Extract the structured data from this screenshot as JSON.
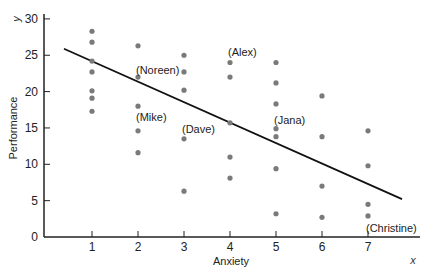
{
  "chart_data": {
    "type": "scatter",
    "title": "",
    "xlabel": "Anxiety",
    "ylabel": "Performance",
    "x_axis_var": "x",
    "y_axis_var": "y",
    "xlim": [
      0,
      8
    ],
    "ylim": [
      0,
      30
    ],
    "xticks": [
      1,
      2,
      3,
      4,
      5,
      6,
      7
    ],
    "yticks": [
      0,
      5,
      10,
      15,
      20,
      25,
      30
    ],
    "grid": false,
    "legend": null,
    "points": [
      {
        "x": 1,
        "y": 28.3
      },
      {
        "x": 1,
        "y": 26.8
      },
      {
        "x": 1,
        "y": 24.2
      },
      {
        "x": 1,
        "y": 22.7
      },
      {
        "x": 1,
        "y": 20.1
      },
      {
        "x": 1,
        "y": 19.1
      },
      {
        "x": 1,
        "y": 17.3
      },
      {
        "x": 2,
        "y": 26.3
      },
      {
        "x": 2,
        "y": 22.0,
        "label": "(Noreen)"
      },
      {
        "x": 2,
        "y": 18.0,
        "label": "(Mike)"
      },
      {
        "x": 2,
        "y": 14.6
      },
      {
        "x": 2,
        "y": 11.6
      },
      {
        "x": 3,
        "y": 25.0
      },
      {
        "x": 3,
        "y": 22.7
      },
      {
        "x": 3,
        "y": 20.2
      },
      {
        "x": 3,
        "y": 13.5,
        "label": "(Dave)"
      },
      {
        "x": 3,
        "y": 6.3
      },
      {
        "x": 4,
        "y": 24.0,
        "label": "(Alex)"
      },
      {
        "x": 4,
        "y": 22.0
      },
      {
        "x": 4,
        "y": 15.7
      },
      {
        "x": 4,
        "y": 11.0
      },
      {
        "x": 4,
        "y": 8.1
      },
      {
        "x": 5,
        "y": 24.0
      },
      {
        "x": 5,
        "y": 21.2
      },
      {
        "x": 5,
        "y": 18.3
      },
      {
        "x": 5,
        "y": 14.9,
        "label": "(Jana)"
      },
      {
        "x": 5,
        "y": 13.8
      },
      {
        "x": 5,
        "y": 9.4
      },
      {
        "x": 5,
        "y": 3.2
      },
      {
        "x": 6,
        "y": 19.4
      },
      {
        "x": 6,
        "y": 13.8
      },
      {
        "x": 6,
        "y": 7.0
      },
      {
        "x": 6,
        "y": 2.7
      },
      {
        "x": 7,
        "y": 14.6
      },
      {
        "x": 7,
        "y": 9.8
      },
      {
        "x": 7,
        "y": 4.5
      },
      {
        "x": 7,
        "y": 2.9,
        "label": "(Christine)"
      }
    ],
    "annotations": [
      {
        "text": "(Noreen)",
        "x": 2.0,
        "y": 23.0
      },
      {
        "text": "(Mike)",
        "x": 2.0,
        "y": 16.5
      },
      {
        "text": "(Dave)",
        "x": 3.0,
        "y": 14.8
      },
      {
        "text": "(Alex)",
        "x": 4.0,
        "y": 25.4
      },
      {
        "text": "(Jana)",
        "x": 5.0,
        "y": 16.1
      },
      {
        "text": "(Christine)",
        "x": 7.0,
        "y": 1.3
      }
    ],
    "regression_line": {
      "x1": 0.39,
      "y1": 25.9,
      "x2": 7.74,
      "y2": 5.2
    }
  },
  "colors": {
    "point": "#7a7a7a",
    "line": "#111111",
    "axis": "#222222"
  }
}
